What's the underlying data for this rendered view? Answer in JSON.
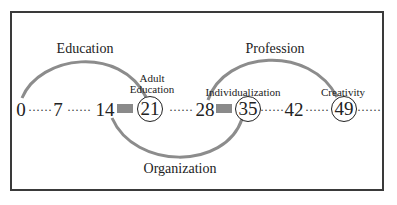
{
  "diagram": {
    "type": "life-stage timeline",
    "timeline": {
      "ages": [
        "0",
        "7",
        "14",
        "21",
        "28",
        "35",
        "42",
        "49"
      ],
      "circled_ages": [
        "21",
        "35",
        "49"
      ],
      "dot_separator": "······"
    },
    "arcs": [
      {
        "label": "Education",
        "from": "0",
        "to": "21",
        "position": "above"
      },
      {
        "label": "Organization",
        "from": "14",
        "to": "35",
        "position": "below"
      },
      {
        "label": "Profession",
        "from": "28",
        "to": "49",
        "position": "above"
      }
    ],
    "milestones": [
      {
        "age": "21",
        "label_line1": "Adult",
        "label_line2": "Education"
      },
      {
        "age": "35",
        "label_line1": "Individualization"
      },
      {
        "age": "49",
        "label_line1": "Creativity"
      }
    ],
    "colors": {
      "arc": "#8c8c8c",
      "marker": "#8a8a8a",
      "frame": "#3a3a3a",
      "text": "#222222"
    }
  }
}
